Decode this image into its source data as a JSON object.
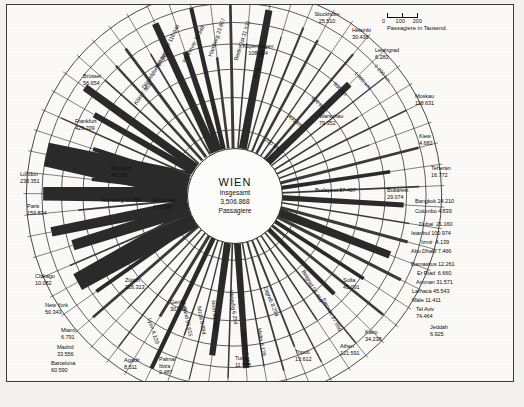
{
  "figure": {
    "center_title": "WIEN",
    "center_line1": "Insgesamt",
    "center_line2": "3,506.868",
    "center_line3": "Passagiere"
  },
  "legend": {
    "scale_ticks": [
      "0",
      "100",
      "200"
    ],
    "caption": "Passagiere in Tausend."
  },
  "rings": [
    {
      "label": "200 km"
    },
    {
      "label": "400 km"
    },
    {
      "label": "600 km"
    },
    {
      "label": "800 km"
    },
    {
      "label": "1 000 km"
    },
    {
      "label": "1 200 km"
    }
  ],
  "chart_data": {
    "type": "bar",
    "subtitle": "Radiale Darstellung der Passagiere nach Zielort",
    "xlabel": "Zielort",
    "ylabel": "Passagiere in Tausend",
    "unit": "Tausend Passagiere",
    "legend_position": "top-right",
    "grid": true,
    "radial_axis_label": "Entfernung (km)",
    "radial_ticks": [
      200,
      400,
      600,
      800,
      1000,
      1200
    ],
    "scale_ticks": [
      0,
      100,
      200
    ],
    "total_passengers": "3,506.868",
    "categories": [
      "Stockholm",
      "Helsinki",
      "Leningrad",
      "Moskau",
      "Kiew",
      "Teheran",
      "Bangkok",
      "Colombo",
      "Dubai",
      "Istanbul",
      "Izmir",
      "Abu Dhabi",
      "Damaskus",
      "Er Riad",
      "Amman",
      "Larnaca",
      "Male",
      "Tel Aviv",
      "Jeddah",
      "Kairo",
      "Athen",
      "Saloniki",
      "Sofia",
      "Bukarest",
      "Belgrad",
      "Zagreb",
      "Malta",
      "Monastir",
      "Tripoli",
      "Tunis",
      "Venedig",
      "Rom",
      "Nizza",
      "Mailand",
      "Palma/Ibiza",
      "Agadir",
      "Barcelona",
      "Madrid",
      "Miami",
      "Lyon",
      "Genf",
      "New York",
      "Zürich",
      "Chikago",
      "München",
      "Paris",
      "Nürnberg",
      "London",
      "Stuttgart",
      "Frankfurt",
      "Brüssel",
      "Köln",
      "Düsseldorf",
      "Amsterdam",
      "Hannover",
      "Hamburg",
      "Berlin/Ost",
      "Prag",
      "Kopenhagen",
      "Warschau",
      "Budapest"
    ],
    "values": [
      25.51,
      30.436,
      6.281,
      110.631,
      4.682,
      16.772,
      24.21,
      4.839,
      21.16,
      100.974,
      4.139,
      7.466,
      12.261,
      6.66,
      31.571,
      45.543,
      11.411,
      74.464,
      6.925,
      34.238,
      121.591,
      37.96,
      45.091,
      29.074,
      56.469,
      8.254,
      8.128,
      6.258,
      13.612,
      11.575,
      6.254,
      93.063,
      8.894,
      96.615,
      2.487,
      8.511,
      60.59,
      33.556,
      6.791,
      4.12,
      30.232,
      50.343,
      316.313,
      10.082,
      178.54,
      159.834,
      10.856,
      238.351,
      46.588,
      429.209,
      56.654,
      7.963,
      87.962,
      116.946,
      11.348,
      23.807,
      31.531,
      12.18,
      108.014,
      79.352,
      57.407
    ]
  },
  "labels": [
    {
      "name": "stockholm",
      "text": "Stockholm\n25.510",
      "x": 290,
      "y": 6,
      "align": "c",
      "w": 60
    },
    {
      "name": "helsinki",
      "text": "Helsinki\n30.436",
      "x": 345,
      "y": 22,
      "align": "l",
      "w": 50
    },
    {
      "name": "leningrad",
      "text": "Leningrad\n6.281",
      "x": 368,
      "y": 42,
      "align": "l",
      "w": 52
    },
    {
      "name": "moskau",
      "text": "Moskau\n110.631",
      "x": 408,
      "y": 88,
      "align": "l",
      "w": 50
    },
    {
      "name": "kiew",
      "text": "Kiew\n4.682",
      "x": 412,
      "y": 128,
      "align": "l",
      "w": 40
    },
    {
      "name": "teheran",
      "text": "Teheran\n16.772",
      "x": 424,
      "y": 160,
      "align": "l",
      "w": 46
    },
    {
      "name": "bangkok",
      "text": "Bangkok 24.210",
      "x": 408,
      "y": 193,
      "align": "l",
      "w": 70
    },
    {
      "name": "colombo",
      "text": "Colombo 4.839",
      "x": 408,
      "y": 203,
      "align": "l",
      "w": 70
    },
    {
      "name": "dubai",
      "text": "Dubai  21.160",
      "x": 412,
      "y": 216,
      "align": "l",
      "w": 70
    },
    {
      "name": "istanbul",
      "text": "Istanbul 100.974",
      "x": 404,
      "y": 225,
      "align": "l",
      "w": 76
    },
    {
      "name": "izmir",
      "text": "Izmir  4.139",
      "x": 414,
      "y": 234,
      "align": "l",
      "w": 70
    },
    {
      "name": "abu-dhabi",
      "text": "Abu Dhabi 7.466",
      "x": 404,
      "y": 243,
      "align": "l",
      "w": 76
    },
    {
      "name": "damaskus",
      "text": "Damaskus 12.261",
      "x": 404,
      "y": 256,
      "align": "l",
      "w": 80
    },
    {
      "name": "er-riad",
      "text": "Er Riad  6.660",
      "x": 410,
      "y": 265,
      "align": "l",
      "w": 74
    },
    {
      "name": "amman",
      "text": "Amman 31.571",
      "x": 409,
      "y": 274,
      "align": "l",
      "w": 74
    },
    {
      "name": "larnaca",
      "text": "Larnaca 45.543",
      "x": 405,
      "y": 283,
      "align": "l",
      "w": 76
    },
    {
      "name": "male",
      "text": "Male 11.411",
      "x": 405,
      "y": 292,
      "align": "l",
      "w": 70
    },
    {
      "name": "tel-aviv",
      "text": "Tel Aviv\n74.464",
      "x": 409,
      "y": 301,
      "align": "l",
      "w": 46
    },
    {
      "name": "jeddah",
      "text": "Jeddah\n6.925",
      "x": 423,
      "y": 319,
      "align": "l",
      "w": 44
    },
    {
      "name": "kairo",
      "text": "Kairo\n34.238",
      "x": 358,
      "y": 324,
      "align": "l",
      "w": 44
    },
    {
      "name": "athen",
      "text": "Athen\n121.591",
      "x": 333,
      "y": 338,
      "align": "l",
      "w": 48
    },
    {
      "name": "tripoli",
      "text": "Tripoli\n13.612",
      "x": 288,
      "y": 344,
      "align": "l",
      "w": 44
    },
    {
      "name": "tunis",
      "text": "Tunis\n11.575",
      "x": 228,
      "y": 350,
      "align": "l",
      "w": 44
    },
    {
      "name": "palma-ibiza",
      "text": "Palma/\nIbiza\n2.487",
      "x": 152,
      "y": 351,
      "align": "l",
      "w": 34
    },
    {
      "name": "agadir",
      "text": "Agadir\n8.511",
      "x": 117,
      "y": 352,
      "align": "l",
      "w": 36
    },
    {
      "name": "barcelona",
      "text": "Barcelona\n60.590",
      "x": 44,
      "y": 355,
      "align": "l",
      "w": 54
    },
    {
      "name": "madrid",
      "text": "Madrid\n33.556",
      "x": 50,
      "y": 339,
      "align": "l",
      "w": 46
    },
    {
      "name": "miami",
      "text": "Miami\n6.791",
      "x": 54,
      "y": 322,
      "align": "l",
      "w": 42
    },
    {
      "name": "new-york",
      "text": "New York\n50.343",
      "x": 38,
      "y": 297,
      "align": "l",
      "w": 54
    },
    {
      "name": "chikago",
      "text": "Chikago\n10.082",
      "x": 28,
      "y": 268,
      "align": "l",
      "w": 50
    },
    {
      "name": "zurich",
      "text": "Zürich\n316.313",
      "x": 118,
      "y": 272,
      "align": "l",
      "w": 48
    },
    {
      "name": "genf",
      "text": "Genf\n30.232",
      "x": 163,
      "y": 294,
      "align": "l",
      "w": 44
    },
    {
      "name": "paris",
      "text": "Paris\n159.834",
      "x": 20,
      "y": 198,
      "align": "l",
      "w": 48
    },
    {
      "name": "london",
      "text": "London\n238.351",
      "x": 13,
      "y": 166,
      "align": "l",
      "w": 50
    },
    {
      "name": "nurnberg",
      "text": "Nürnberg 10.856",
      "x": 94,
      "y": 192,
      "align": "l",
      "w": 76
    },
    {
      "name": "munchen",
      "text": "München\n178.540",
      "x": 146,
      "y": 192,
      "align": "l",
      "w": 52
    },
    {
      "name": "stuttgart",
      "text": "Stuttgart\n46.588",
      "x": 104,
      "y": 160,
      "align": "l",
      "w": 50
    },
    {
      "name": "frankfurt",
      "text": "Frankfurt\n429.209",
      "x": 68,
      "y": 113,
      "align": "l",
      "w": 52
    },
    {
      "name": "brussel",
      "text": "Brüssel\n56.654",
      "x": 76,
      "y": 68,
      "align": "l",
      "w": 48
    },
    {
      "name": "kopenhagen",
      "text": "Kopenhagen\n108.014",
      "x": 216,
      "y": 38,
      "align": "c",
      "w": 70
    },
    {
      "name": "warschau",
      "text": "Warschau\n79.352",
      "x": 312,
      "y": 108,
      "align": "l",
      "w": 54
    },
    {
      "name": "budapest",
      "text": "Budapest 57.407",
      "x": 308,
      "y": 182,
      "align": "l",
      "w": 80
    },
    {
      "name": "bukarest",
      "text": "Bukarest\n29.074",
      "x": 380,
      "y": 182,
      "align": "l",
      "w": 50
    }
  ],
  "rotated_labels": [
    {
      "name": "amsterdam",
      "text": "Amsterdam 116.946",
      "x": 150,
      "y": 60,
      "rot": -64
    },
    {
      "name": "hannover",
      "text": "Hannover 11.348",
      "x": 177,
      "y": 54,
      "rot": -62
    },
    {
      "name": "hamburg",
      "text": "Hamburg 23.807",
      "x": 203,
      "y": 48,
      "rot": -70
    },
    {
      "name": "berlin-ost",
      "text": "Berlin/Ost 31.531",
      "x": 229,
      "y": 52,
      "rot": -72
    },
    {
      "name": "prag",
      "text": "Prag 12.180",
      "x": 248,
      "y": 70,
      "rot": -74
    },
    {
      "name": "dusseldorf",
      "text": "Düsseldorf 87.962",
      "x": 136,
      "y": 80,
      "rot": -56
    },
    {
      "name": "koln",
      "text": "Köln 7.963",
      "x": 128,
      "y": 96,
      "rot": -54
    },
    {
      "name": "zagreb",
      "text": "Zagreb 8.254",
      "x": 258,
      "y": 278,
      "rot": 68
    },
    {
      "name": "belgrad",
      "text": "Belgrad 56.469",
      "x": 296,
      "y": 262,
      "rot": 60
    },
    {
      "name": "sofia",
      "text": "Sofia\n45.091",
      "x": 336,
      "y": 272,
      "rot": 0
    },
    {
      "name": "saloniki",
      "text": "Saloniki 37.960",
      "x": 316,
      "y": 290,
      "rot": 62
    },
    {
      "name": "malta",
      "text": "Malta 8.128",
      "x": 252,
      "y": 320,
      "rot": 80
    },
    {
      "name": "monastir",
      "text": "Monastir 6.258",
      "x": 236,
      "y": 322,
      "rot": 82
    },
    {
      "name": "venedig",
      "text": "Venedig 6.254",
      "x": 224,
      "y": 282,
      "rot": 82
    },
    {
      "name": "rom",
      "text": "Rom 93.063",
      "x": 206,
      "y": 292,
      "rot": 84
    },
    {
      "name": "nizza",
      "text": "Nizza 8.894",
      "x": 192,
      "y": 298,
      "rot": 80
    },
    {
      "name": "mailand",
      "text": "Mailand 96.615",
      "x": 176,
      "y": 292,
      "rot": 78
    },
    {
      "name": "lyon",
      "text": "Lyon 4.120",
      "x": 142,
      "y": 310,
      "rot": 72
    }
  ]
}
